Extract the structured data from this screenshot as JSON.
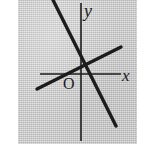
{
  "figure": {
    "name": "coordinate-plane-two-lines",
    "background_color": "#c8c8c8",
    "page_color": "#ffffff",
    "ink_color": "#1c1c1c",
    "plate": {
      "x": 18,
      "y": 0,
      "width": 119,
      "height": 144
    }
  },
  "labels": {
    "y_axis": "y",
    "x_axis": "x",
    "origin": "O"
  },
  "chart_data": {
    "type": "line",
    "title": "",
    "xlabel": "x",
    "ylabel": "y",
    "grid": false,
    "legend": "none",
    "origin_label": "O",
    "axes": {
      "x_axis": {
        "x1": 40,
        "y1": 74,
        "x2": 121,
        "y2": 74,
        "stroke": "#1c1c1c",
        "width": 1.6
      },
      "y_axis": {
        "x1": 81,
        "y1": 3,
        "x2": 81,
        "y2": 141,
        "stroke": "#1c1c1c",
        "width": 1.6
      }
    },
    "origin_point": {
      "x": 81,
      "y": 74
    },
    "intersection_point": {
      "x": 83,
      "y": 60
    },
    "series": [
      {
        "name": "descending-line",
        "description": "steep line with negative slope through second and fourth quadrants",
        "slope_sign": "negative",
        "endpoints": [
          {
            "x": 53,
            "y": 0
          },
          {
            "x": 116,
            "y": 126
          }
        ],
        "stroke": "#1c1c1c",
        "width": 3.4
      },
      {
        "name": "ascending-line",
        "description": "shallow line with positive slope crossing the descending line above the x-axis",
        "slope_sign": "positive",
        "endpoints": [
          {
            "x": 37,
            "y": 89
          },
          {
            "x": 121,
            "y": 47
          }
        ],
        "stroke": "#1c1c1c",
        "width": 3.4
      }
    ]
  }
}
